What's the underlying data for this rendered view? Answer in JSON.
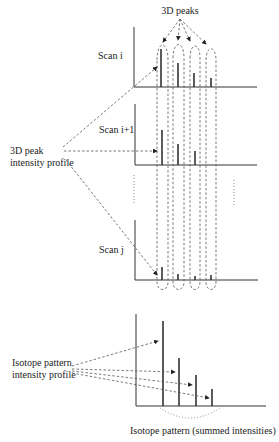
{
  "diagram": {
    "top_label": "3D peaks",
    "scans": [
      {
        "label": "Scan i",
        "peak_heights": [
          38,
          24,
          14,
          9
        ]
      },
      {
        "label": "Scan i+1",
        "peak_heights": [
          35,
          21,
          14,
          0
        ]
      },
      {
        "label": "Scan j",
        "peak_heights": [
          13,
          6,
          4,
          5
        ]
      }
    ],
    "left_label_3d": [
      "3D peak",
      "intensity profile"
    ],
    "isotope_label": [
      "Isotope pattern",
      "intensity profile"
    ],
    "isotope_peak_heights": [
      85,
      48,
      31,
      17
    ],
    "bottom_caption": "Isotope pattern (summed intensities)",
    "colors": {
      "line": "#333333",
      "dash": "#555555",
      "background": "#ffffff"
    }
  }
}
